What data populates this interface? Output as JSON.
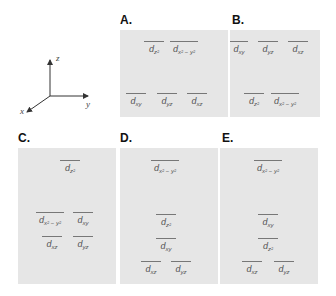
{
  "axes": {
    "x_label": "x",
    "y_label": "y",
    "z_label": "z"
  },
  "panels": [
    {
      "label": "A.",
      "levels": [
        {
          "id": "upper",
          "orbitals": [
            {
              "d": "d",
              "sub": "z²"
            },
            {
              "d": "d",
              "sub": "x² − y²"
            }
          ]
        },
        {
          "id": "lower",
          "orbitals": [
            {
              "d": "d",
              "sub": "xy"
            },
            {
              "d": "d",
              "sub": "yz"
            },
            {
              "d": "d",
              "sub": "xz"
            }
          ]
        }
      ]
    },
    {
      "label": "B.",
      "levels": [
        {
          "id": "upper",
          "orbitals": [
            {
              "d": "d",
              "sub": "xy"
            },
            {
              "d": "d",
              "sub": "yz"
            },
            {
              "d": "d",
              "sub": "xz"
            }
          ]
        },
        {
          "id": "lower",
          "orbitals": [
            {
              "d": "d",
              "sub": "z²"
            },
            {
              "d": "d",
              "sub": "x² − y²"
            }
          ]
        }
      ]
    },
    {
      "label": "C.",
      "levels": [
        {
          "id": "top",
          "orbitals": [
            {
              "d": "d",
              "sub": "z²"
            }
          ]
        },
        {
          "id": "middle",
          "orbitals": [
            {
              "d": "d",
              "sub": "x² − y²"
            },
            {
              "d": "d",
              "sub": "xy"
            }
          ]
        },
        {
          "id": "bottom",
          "orbitals": [
            {
              "d": "d",
              "sub": "xz"
            },
            {
              "d": "d",
              "sub": "yz"
            }
          ]
        }
      ]
    },
    {
      "label": "D.",
      "levels": [
        {
          "id": "top",
          "orbitals": [
            {
              "d": "d",
              "sub": "x² − y²"
            }
          ]
        },
        {
          "id": "second",
          "orbitals": [
            {
              "d": "d",
              "sub": "z²"
            }
          ]
        },
        {
          "id": "third",
          "orbitals": [
            {
              "d": "d",
              "sub": "xy"
            }
          ]
        },
        {
          "id": "bottom",
          "orbitals": [
            {
              "d": "d",
              "sub": "xz"
            },
            {
              "d": "d",
              "sub": "yz"
            }
          ]
        }
      ]
    },
    {
      "label": "E.",
      "levels": [
        {
          "id": "top",
          "orbitals": [
            {
              "d": "d",
              "sub": "x² − y²"
            }
          ]
        },
        {
          "id": "second",
          "orbitals": [
            {
              "d": "d",
              "sub": "xy"
            }
          ]
        },
        {
          "id": "third",
          "orbitals": [
            {
              "d": "d",
              "sub": "z²"
            }
          ]
        },
        {
          "id": "bottom",
          "orbitals": [
            {
              "d": "d",
              "sub": "xz"
            },
            {
              "d": "d",
              "sub": "yz"
            }
          ]
        }
      ]
    }
  ],
  "colors": {
    "panel_bg": "#e6e6e6",
    "line": "#777777",
    "text": "#555555"
  }
}
